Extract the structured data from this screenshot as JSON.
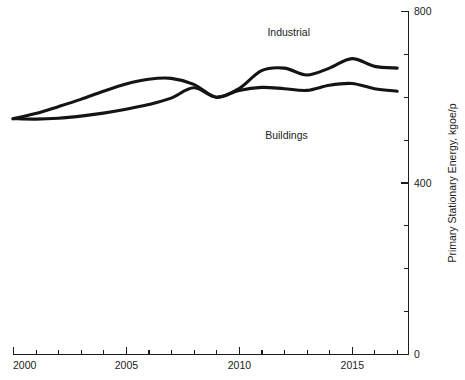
{
  "chart_data": {
    "type": "line",
    "title": "",
    "subtitle": "",
    "xlabel": "",
    "ylabel": "Primary Stationary Energy, kgoe/p",
    "xlim": [
      2000,
      2017.5
    ],
    "ylim": [
      0,
      800
    ],
    "grid": false,
    "legend_position": "inline-annotation",
    "x_major_ticks": [
      2000,
      2005,
      2010,
      2015
    ],
    "x_major_tick_labels": [
      "2000",
      "2005",
      "2010",
      "2015"
    ],
    "x_minor_ticks": [
      2001,
      2002,
      2003,
      2004,
      2006,
      2007,
      2008,
      2009,
      2011,
      2012,
      2013,
      2014,
      2016,
      2017
    ],
    "y_major_ticks": [
      0,
      400,
      800
    ],
    "y_major_tick_labels": [
      "0",
      "400",
      "800"
    ],
    "y_minor_ticks": [
      100,
      200,
      300,
      500,
      600,
      700
    ],
    "axis_side_y": "right",
    "x": [
      2000,
      2001,
      2002,
      2003,
      2004,
      2005,
      2006,
      2007,
      2008,
      2009,
      2010,
      2011,
      2012,
      2013,
      2014,
      2015,
      2016,
      2017
    ],
    "series": [
      {
        "name": "Industrial",
        "color": "#141414",
        "label_x": 2012.2,
        "label_y": 742,
        "values": [
          550,
          549,
          551,
          556,
          563,
          572,
          583,
          598,
          622,
          600,
          620,
          662,
          668,
          652,
          668,
          690,
          672,
          668
        ]
      },
      {
        "name": "Buildings",
        "color": "#141414",
        "label_x": 2012.1,
        "label_y": 503,
        "values": [
          550,
          562,
          578,
          595,
          614,
          631,
          642,
          644,
          630,
          600,
          616,
          623,
          620,
          616,
          628,
          632,
          620,
          614
        ]
      }
    ],
    "series_end_values": {
      "Industrial": 681,
      "Buildings": 620
    }
  },
  "annotations": {
    "industrial_label": "Industrial",
    "buildings_label": "Buildings"
  },
  "axis": {
    "y_title": "Primary Stationary Energy, kgoe/p",
    "y_tick_0": "0",
    "y_tick_400": "400",
    "y_tick_800": "800",
    "x_tick_2000": "2000",
    "x_tick_2005": "2005",
    "x_tick_2010": "2010",
    "x_tick_2015": "2015"
  }
}
